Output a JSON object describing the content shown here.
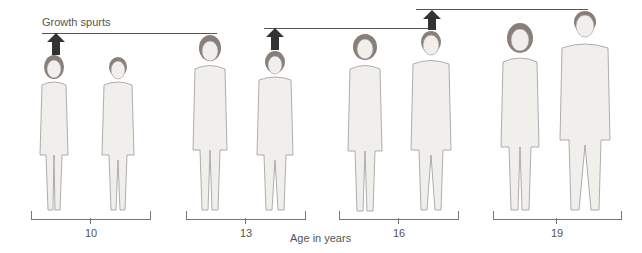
{
  "title": "Growth spurts",
  "xlabel": "Age in years",
  "groups": [
    {
      "age": "10",
      "figures": [
        "girl",
        "boy"
      ]
    },
    {
      "age": "13",
      "figures": [
        "girl",
        "boy"
      ]
    },
    {
      "age": "16",
      "figures": [
        "girl",
        "boy"
      ]
    },
    {
      "age": "19",
      "figures": [
        "girl",
        "boy"
      ]
    }
  ],
  "annotations": {
    "arrow_1": "growth spurt girls (age 10)",
    "arrow_2": "growth spurt boys (age 13)",
    "arrow_3": "growth spurt boys (age 16)"
  },
  "colors": {
    "skin": "#f1efec",
    "outline": "#9a9a9a",
    "hair": "#8a7e78",
    "arrow": "#333333",
    "line": "#555555"
  }
}
